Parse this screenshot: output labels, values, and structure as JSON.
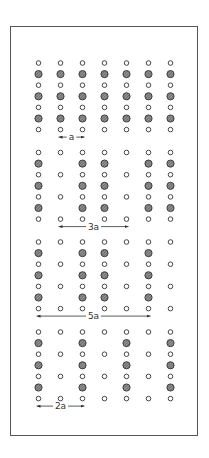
{
  "diagram": {
    "columns": 7,
    "rows_per_section": 7,
    "legend": {
      "open_circle": "lattice site",
      "hatched_circle": "occupied site"
    },
    "sections": [
      {
        "label": "a",
        "hatched_columns": [
          1,
          2,
          3,
          4,
          5,
          6,
          7
        ],
        "label_from_col": 2,
        "label_to_col": 3
      },
      {
        "label": "3a",
        "hatched_columns": [
          1,
          3,
          4,
          6,
          7
        ],
        "label_from_col": 2,
        "label_to_col": 5
      },
      {
        "label": "5a",
        "hatched_columns": [
          1,
          3,
          4,
          6
        ],
        "label_from_col": 1,
        "label_to_col": 6
      },
      {
        "label": "2a",
        "hatched_columns": [
          1,
          3,
          5,
          7
        ],
        "label_from_col": 1,
        "label_to_col": 3
      }
    ]
  },
  "labels": {
    "s1": "a",
    "s2": "3a",
    "s3": "5a",
    "s4": "2a"
  }
}
